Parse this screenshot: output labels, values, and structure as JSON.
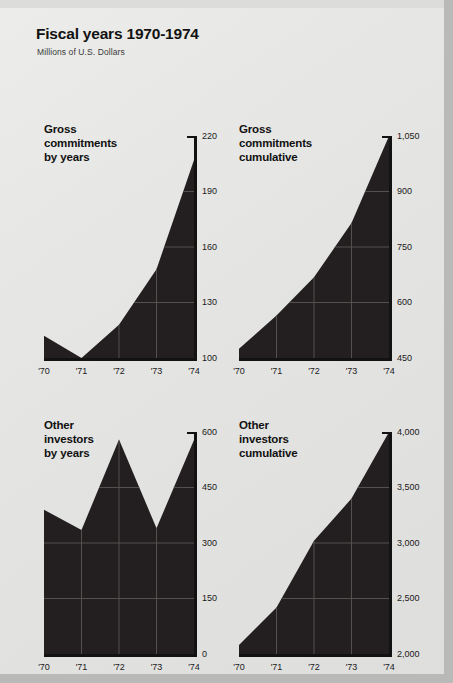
{
  "header": {
    "title": "Fiscal years 1970-1974",
    "subtitle": "Millions of U.S. Dollars"
  },
  "chart_data": [
    {
      "type": "area",
      "id": "gross-commitments-by-years",
      "title": "Gross commitments\nby years",
      "categories": [
        "'70",
        "'71",
        "'72",
        "'73",
        "'74"
      ],
      "values": [
        112,
        100,
        118,
        148,
        207
      ],
      "xlabel": "",
      "ylabel": "",
      "ylim": [
        100,
        220
      ],
      "yticks": [
        100,
        130,
        160,
        190,
        220
      ],
      "yticklabels": [
        "100",
        "130",
        "160",
        "190",
        "220"
      ],
      "grid": true,
      "fill_color": "#231f20",
      "legend": "none"
    },
    {
      "type": "area",
      "id": "gross-commitments-cumulative",
      "title": "Gross commitments\ncumulative",
      "categories": [
        "'70",
        "'71",
        "'72",
        "'73",
        "'74"
      ],
      "values": [
        475,
        565,
        668,
        815,
        1050
      ],
      "xlabel": "",
      "ylabel": "",
      "ylim": [
        450,
        1050
      ],
      "yticks": [
        450,
        600,
        750,
        900,
        1050
      ],
      "yticklabels": [
        "450",
        "600",
        "750",
        "900",
        "1,050"
      ],
      "grid": true,
      "fill_color": "#231f20",
      "legend": "none"
    },
    {
      "type": "area",
      "id": "other-investors-by-years",
      "title": "Other investors\nby years",
      "categories": [
        "'70",
        "'71",
        "'72",
        "'73",
        "'74"
      ],
      "values": [
        390,
        335,
        580,
        340,
        578
      ],
      "xlabel": "",
      "ylabel": "",
      "ylim": [
        0,
        600
      ],
      "yticks": [
        0,
        150,
        300,
        450,
        600
      ],
      "yticklabels": [
        "0",
        "150",
        "300",
        "450",
        "600"
      ],
      "grid": true,
      "fill_color": "#231f20",
      "legend": "none"
    },
    {
      "type": "area",
      "id": "other-investors-cumulative",
      "title": "Other investors\ncumulative",
      "categories": [
        "'70",
        "'71",
        "'72",
        "'73",
        "'74"
      ],
      "values": [
        2080,
        2420,
        3020,
        3400,
        4000
      ],
      "xlabel": "",
      "ylabel": "",
      "ylim": [
        2000,
        4000
      ],
      "yticks": [
        2000,
        2500,
        3000,
        3500,
        4000
      ],
      "yticklabels": [
        "2,000",
        "2,500",
        "3,000",
        "3,500",
        "4,000"
      ],
      "grid": true,
      "fill_color": "#231f20",
      "legend": "none"
    }
  ]
}
